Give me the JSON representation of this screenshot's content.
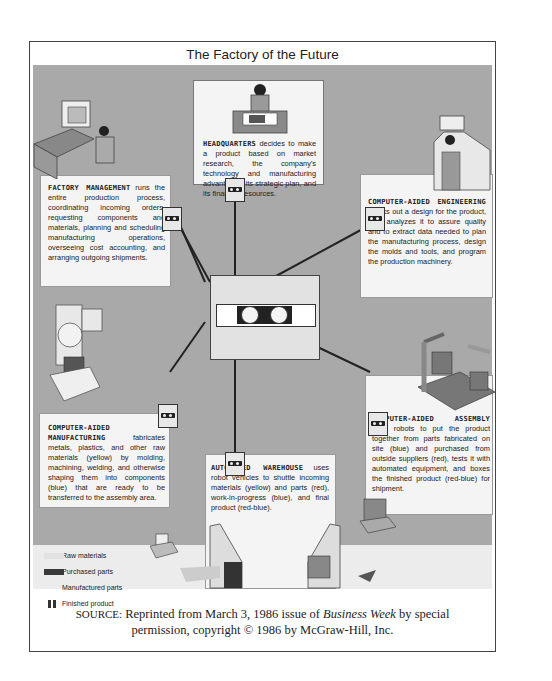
{
  "figure": {
    "title": "The Factory of the Future",
    "nodes": [
      {
        "id": "headquarters",
        "heading": "HEADQUARTERS",
        "body": " decides to make a product based on market research, the company's technology and manufacturing advantages, its strategic plan, and its financial resources."
      },
      {
        "id": "factory-management",
        "heading": "FACTORY MANAGEMENT",
        "body": " runs the entire production process, coordinating incoming orders, requesting components and materials, planning and scheduling manufacturing operations, overseeing cost accounting, and arranging outgoing shipments."
      },
      {
        "id": "computer-aided-engineering",
        "heading": "COMPUTER-AIDED ENGINEERING",
        "body": " cranks out a design for the product, then analyzes it to assure quality and to extract data needed to plan the manufacturing process, design the molds and tools, and program the production machinery."
      },
      {
        "id": "computer-aided-manufacturing",
        "heading": "COMPUTER-AIDED MANUFACTURING",
        "body": " fabricates metals, plastics, and other raw materials (yellow) by molding, machining, welding, and otherwise shaping them into components (blue) that are ready to be transferred to the assembly area."
      },
      {
        "id": "computer-aided-assembly",
        "heading": "COMPUTER-AIDED ASSEMBLY",
        "body": " uses robots to put the product together from parts fabricated on site (blue) and purchased from outside suppliers (red), tests it with automated equipment, and boxes the finished product (red-blue) for shipment."
      },
      {
        "id": "automated-warehouse",
        "heading": "AUTOMATED WAREHOUSE",
        "body": " uses robot vehicles to shuttle incoming materials (yellow) and parts (red), work-in-progress (blue), and final product (red-blue)."
      }
    ],
    "hub": "central-computer",
    "legend": [
      {
        "label": "Raw materials",
        "swatch": "#e2e2e2"
      },
      {
        "label": "Purchased parts",
        "swatch": "#3a3a3a"
      },
      {
        "label": "Manufactured parts",
        "swatch": "#a9a9a9"
      },
      {
        "label": "Finished product",
        "swatch": "#333333"
      }
    ],
    "colors": {
      "background": "#a9a9a9",
      "panel": "#f4f4f4",
      "line": "#222222"
    }
  },
  "source": {
    "label": "SOURCE:",
    "line1_pre": " Reprinted from March 3, 1986 issue of ",
    "publication": "Business Week",
    "line1_post": " by special",
    "line2": "permission, copyright © 1986 by McGraw-Hill, Inc."
  }
}
